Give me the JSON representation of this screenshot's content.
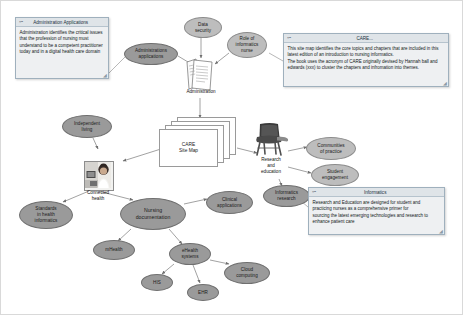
{
  "diagram": {
    "title": "CARE Site Map",
    "center_document": {
      "label": "CARE\nSite Map"
    },
    "icons": {
      "administration": {
        "name": "administration-documents-icon",
        "caption": "Administration"
      },
      "connected_health": {
        "name": "nurse-photo",
        "caption": "Connected\nhealth"
      },
      "research_education": {
        "name": "classroom-chair-icon",
        "caption": "Research\nand\neducation"
      }
    },
    "nodes": [
      {
        "id": "administrations-applications",
        "label": "Administrations\napplications",
        "x": 123,
        "y": 42,
        "w": 54,
        "h": 22,
        "tone": "dark"
      },
      {
        "id": "data-security",
        "label": "Data\nsecurity",
        "x": 183,
        "y": 16,
        "w": 38,
        "h": 21,
        "tone": "light"
      },
      {
        "id": "role-of-informatics-nurse",
        "label": "Role of\ninformatics\nnurse",
        "x": 226,
        "y": 31,
        "w": 40,
        "h": 26,
        "tone": "light"
      },
      {
        "id": "independent-living",
        "label": "Independent\nliving",
        "x": 61,
        "y": 114,
        "w": 50,
        "h": 23,
        "tone": "dark"
      },
      {
        "id": "communities-of-practice",
        "label": "Communities\nof practice",
        "x": 305,
        "y": 136,
        "w": 50,
        "h": 23,
        "tone": "light"
      },
      {
        "id": "student-engagement",
        "label": "Student\nengagement",
        "x": 310,
        "y": 163,
        "w": 48,
        "h": 22,
        "tone": "light"
      },
      {
        "id": "informatics-research",
        "label": "Informatics\nresearch",
        "x": 262,
        "y": 184,
        "w": 47,
        "h": 22,
        "tone": "dark"
      },
      {
        "id": "standards-in-health-informatics",
        "label": "Standards\nin health\ninformatics",
        "x": 18,
        "y": 200,
        "w": 54,
        "h": 28,
        "tone": "dark"
      },
      {
        "id": "clinical-applications",
        "label": "Clinical\napplications",
        "x": 205,
        "y": 190,
        "w": 47,
        "h": 23,
        "tone": "dark"
      },
      {
        "id": "nursing-documentation",
        "label": "Nursing\ndocumentation",
        "x": 119,
        "y": 197,
        "w": 66,
        "h": 32,
        "tone": "dark"
      },
      {
        "id": "mhealth",
        "label": "mHealth",
        "x": 92,
        "y": 239,
        "w": 42,
        "h": 20,
        "tone": "dark"
      },
      {
        "id": "ehealth-systems",
        "label": "eHealth\nsystems",
        "x": 168,
        "y": 242,
        "w": 42,
        "h": 22,
        "tone": "dark"
      },
      {
        "id": "his",
        "label": "HIS",
        "x": 140,
        "y": 273,
        "w": 32,
        "h": 17,
        "tone": "dark"
      },
      {
        "id": "ehr",
        "label": "EHR",
        "x": 186,
        "y": 283,
        "w": 32,
        "h": 17,
        "tone": "dark"
      },
      {
        "id": "cloud-computing",
        "label": "Cloud\ncomputing",
        "x": 223,
        "y": 261,
        "w": 46,
        "h": 22,
        "tone": "dark"
      }
    ],
    "notes": [
      {
        "id": "administration-applications-note",
        "title": "Administration Applications",
        "glyph": "❝❞",
        "body": "Administration identifies the critical issues that the profession of nursing must understand to be a competent practitioner today and in a digital health care domain",
        "x": 14,
        "y": 16,
        "w": 94,
        "h": 62
      },
      {
        "id": "care-note",
        "title": "CARE...",
        "glyph": "❝❞",
        "body": "This site map identifies the core topics and chapters that are included in this latest edition of an introduction to nursing informatics.\nThe book uses the acronym of CARE originally devised by Hannah ball and edwards (xxx) to cluster the chapters and infromation into themes.",
        "x": 282,
        "y": 32,
        "w": 166,
        "h": 54
      },
      {
        "id": "informatics-note",
        "title": "Informatics",
        "glyph": "❝❞",
        "body": "Research and Education are designed for student and practicing nurses as a comprehensive primer for\nsourcing the latest emerging technologies and research to enhance patient care",
        "x": 307,
        "y": 186,
        "w": 137,
        "h": 48
      }
    ],
    "edges": [
      {
        "from": "administrations-applications",
        "to": "administration-icon"
      },
      {
        "from": "data-security",
        "to": "administration-icon"
      },
      {
        "from": "role-of-informatics-nurse",
        "to": "administration-icon"
      },
      {
        "from": "administration-icon",
        "to": "care-site-map"
      },
      {
        "from": "care-site-map",
        "to": "connected-health"
      },
      {
        "from": "independent-living",
        "to": "connected-health"
      },
      {
        "from": "connected-health",
        "to": "standards-in-health-informatics"
      },
      {
        "from": "connected-health",
        "to": "nursing-documentation"
      },
      {
        "from": "care-site-map",
        "to": "research-and-education"
      },
      {
        "from": "research-and-education",
        "to": "communities-of-practice"
      },
      {
        "from": "research-and-education",
        "to": "student-engagement"
      },
      {
        "from": "research-and-education",
        "to": "informatics-research"
      },
      {
        "from": "nursing-documentation",
        "to": "clinical-applications"
      },
      {
        "from": "nursing-documentation",
        "to": "mhealth"
      },
      {
        "from": "nursing-documentation",
        "to": "ehealth-systems"
      },
      {
        "from": "ehealth-systems",
        "to": "his"
      },
      {
        "from": "ehealth-systems",
        "to": "ehr"
      },
      {
        "from": "ehealth-systems",
        "to": "cloud-computing"
      }
    ],
    "colors": {
      "node_fill": "#a8a8a8",
      "node_fill_light": "#bdbdbd",
      "node_stroke": "#7b7b7b",
      "note_fill": "#eef0f2",
      "note_stroke": "#9fb0bd",
      "edge": "#8a8a8a",
      "canvas": "#ffffff"
    }
  }
}
